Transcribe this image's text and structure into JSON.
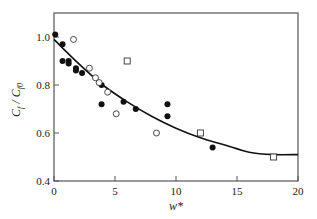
{
  "chart_data": {
    "type": "scatter",
    "title": "",
    "xlabel": "w*",
    "ylabel": "C_f / C_f0",
    "xlim": [
      0,
      20
    ],
    "ylim": [
      0.4,
      1.1
    ],
    "xticks": [
      0,
      5,
      10,
      15,
      20
    ],
    "yticks": [
      0.4,
      0.6,
      0.8,
      1.0
    ],
    "xtick_labels": [
      "0",
      "5",
      "10",
      "15",
      "20"
    ],
    "ytick_labels": [
      "0.4",
      "0.6",
      "0.8",
      "1.0"
    ],
    "grid": false,
    "legend": null,
    "series": [
      {
        "name": "filled circles",
        "marker": "filled-circle",
        "points": [
          [
            0.1,
            1.01
          ],
          [
            0.7,
            0.97
          ],
          [
            0.7,
            0.9
          ],
          [
            1.2,
            0.9
          ],
          [
            1.2,
            0.89
          ],
          [
            1.8,
            0.87
          ],
          [
            1.8,
            0.86
          ],
          [
            2.3,
            0.85
          ],
          [
            3.9,
            0.8
          ],
          [
            3.9,
            0.72
          ],
          [
            5.7,
            0.73
          ],
          [
            6.7,
            0.7
          ],
          [
            9.3,
            0.72
          ],
          [
            9.3,
            0.67
          ],
          [
            13.0,
            0.54
          ]
        ]
      },
      {
        "name": "open circles",
        "marker": "open-circle",
        "points": [
          [
            1.6,
            0.99
          ],
          [
            2.9,
            0.87
          ],
          [
            3.4,
            0.83
          ],
          [
            3.7,
            0.81
          ],
          [
            4.4,
            0.77
          ],
          [
            5.1,
            0.68
          ],
          [
            8.4,
            0.6
          ]
        ]
      },
      {
        "name": "open squares",
        "marker": "open-square",
        "points": [
          [
            6.0,
            0.9
          ],
          [
            12.0,
            0.6
          ],
          [
            18.0,
            0.5
          ]
        ]
      },
      {
        "name": "fit curve",
        "marker": "line",
        "points": [
          [
            0,
            0.99
          ],
          [
            2,
            0.89
          ],
          [
            4,
            0.8
          ],
          [
            6,
            0.73
          ],
          [
            8,
            0.67
          ],
          [
            10,
            0.62
          ],
          [
            12,
            0.58
          ],
          [
            14,
            0.55
          ],
          [
            16,
            0.52
          ],
          [
            18,
            0.51
          ],
          [
            20,
            0.51
          ]
        ]
      }
    ]
  },
  "colors": {
    "axis": "#555555",
    "marker": "#111111",
    "curve": "#111111",
    "background": "#ffffff"
  }
}
